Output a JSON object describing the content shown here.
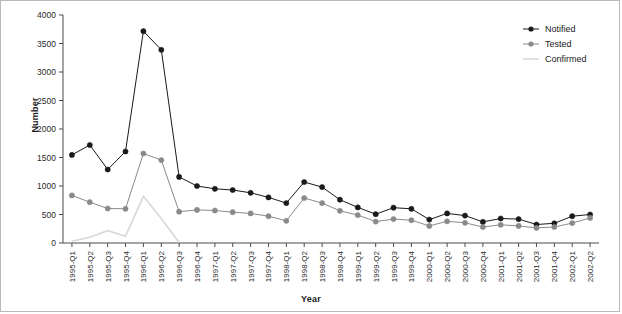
{
  "chart_data": {
    "type": "line",
    "title": "",
    "xlabel": "Year",
    "ylabel": "Number",
    "ylim": [
      0,
      4000
    ],
    "yticks": [
      0,
      500,
      1000,
      1500,
      2000,
      2500,
      3000,
      3500,
      4000
    ],
    "grid": false,
    "legend_position": "top-right",
    "categories": [
      "1995-Q1",
      "1995-Q2",
      "1995-Q3",
      "1995-Q4",
      "1996-Q1",
      "1996-Q2",
      "1996-Q3",
      "1996-Q4",
      "1997-Q1",
      "1997-Q2",
      "1997-Q3",
      "1997-Q4",
      "1998-Q1",
      "1998-Q2",
      "1998-Q3",
      "1998-Q4",
      "1999-Q1",
      "1999-Q2",
      "1999-Q3",
      "1999-Q4",
      "2000-Q1",
      "2000-Q2",
      "2000-Q3",
      "2000-Q4",
      "2001-Q1",
      "2001-Q2",
      "2001-Q3",
      "2001-Q4",
      "2002-Q1",
      "2002-Q2"
    ],
    "series": [
      {
        "name": "Notified",
        "color": "#1a1a1a",
        "marker": "circle",
        "values": [
          1545,
          1720,
          1290,
          1605,
          3715,
          3390,
          1160,
          1000,
          950,
          930,
          880,
          800,
          700,
          1070,
          980,
          760,
          625,
          505,
          620,
          600,
          410,
          520,
          480,
          370,
          430,
          420,
          325,
          345,
          470,
          500
        ]
      },
      {
        "name": "Tested",
        "color": "#8a8a8a",
        "marker": "circle",
        "values": [
          835,
          715,
          605,
          600,
          1570,
          1455,
          550,
          580,
          570,
          540,
          520,
          470,
          390,
          790,
          700,
          565,
          490,
          375,
          420,
          400,
          300,
          380,
          355,
          280,
          320,
          300,
          265,
          280,
          350,
          440
        ]
      },
      {
        "name": "Confirmed",
        "color": "#d8d8d8",
        "marker": "none",
        "values": [
          30,
          100,
          215,
          120,
          820,
          430,
          10,
          null,
          null,
          null,
          null,
          null,
          null,
          null,
          null,
          null,
          null,
          null,
          null,
          null,
          null,
          null,
          null,
          null,
          null,
          null,
          null,
          null,
          null,
          null
        ]
      }
    ]
  },
  "legend": {
    "items": [
      {
        "label": "Notified"
      },
      {
        "label": "Tested"
      },
      {
        "label": "Confirmed"
      }
    ]
  }
}
